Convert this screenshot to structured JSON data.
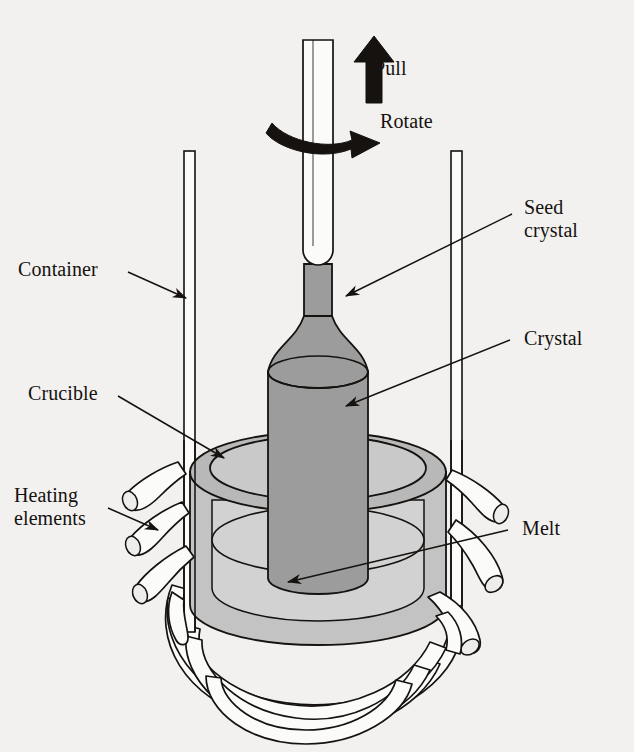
{
  "figure": {
    "kind": "technical-line-diagram",
    "background_color": "#f2f1ef",
    "ink_color": "#15120f",
    "fills": {
      "crystal_gray": "#9c9c9c",
      "crystal_shadow_gray": "#8d8d8d",
      "melt_gray": "#d2d2d2",
      "crucible_wall_gray": "#c3c3c3",
      "crucible_rim_gray": "#b8b8b8",
      "tube_white": "#fbfbfa"
    }
  },
  "labels": {
    "pull": "Pull",
    "rotate": "Rotate",
    "seed_crystal": "Seed\ncrystal",
    "crystal": "Crystal",
    "container": "Container",
    "crucible": "Crucible",
    "heating_elements": "Heating\nelements",
    "melt": "Melt"
  },
  "annotations": [
    {
      "id": "pull",
      "text": "Pull",
      "side": "top",
      "marker": "solid-straight-arrow-up"
    },
    {
      "id": "rotate",
      "text": "Rotate",
      "side": "top",
      "marker": "solid-curved-arrow-right"
    },
    {
      "id": "seed-crystal",
      "text": "Seed crystal",
      "side": "right",
      "marker": "leader-line-with-arrowhead"
    },
    {
      "id": "crystal",
      "text": "Crystal",
      "side": "right",
      "marker": "leader-line-with-arrowhead"
    },
    {
      "id": "melt",
      "text": "Melt",
      "side": "right",
      "marker": "leader-line-with-arrowhead"
    },
    {
      "id": "container",
      "text": "Container",
      "side": "left",
      "marker": "leader-line-with-arrowhead"
    },
    {
      "id": "crucible",
      "text": "Crucible",
      "side": "left",
      "marker": "leader-line-with-arrowhead"
    },
    {
      "id": "heating-elements",
      "text": "Heating elements",
      "side": "left",
      "marker": "leader-line-with-arrowhead"
    }
  ],
  "parts": [
    {
      "id": "seed-rod",
      "name": "Seed holder rod",
      "fill": "#fbfbfa"
    },
    {
      "id": "crystal-neck",
      "name": "Crystal neck",
      "fill": "#9c9c9c"
    },
    {
      "id": "crystal-body",
      "name": "Grown crystal boule",
      "fill": "#9c9c9c"
    },
    {
      "id": "crucible",
      "name": "Crucible",
      "fill": "#c3c3c3"
    },
    {
      "id": "melt",
      "name": "Molten charge",
      "fill": "#d2d2d2"
    },
    {
      "id": "container-walls",
      "name": "Container walls",
      "fill": "#fbfbfa"
    },
    {
      "id": "heating-coil",
      "name": "Heating element coil",
      "fill": "#fbfbfa"
    }
  ]
}
